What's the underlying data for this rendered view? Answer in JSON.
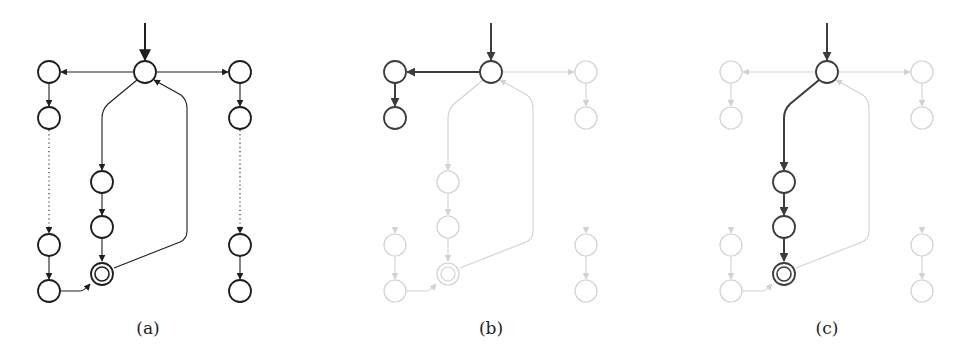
{
  "figure": {
    "colors": {
      "normal": "#1e1e1e",
      "highlight": "#3c3c3c",
      "faded": "#d2d2d2",
      "background": "#ffffff"
    },
    "node_radius": 11,
    "panels": [
      {
        "id": "a",
        "caption": "(a)",
        "caption_x": 148,
        "offset_x": 0,
        "style": "normal",
        "highlight_nodes": [],
        "highlight_edges": []
      },
      {
        "id": "b",
        "caption": "(b)",
        "caption_x": 491,
        "offset_x": 346,
        "style": "faded",
        "highlight_nodes": [
          "top",
          "L1",
          "L2"
        ],
        "highlight_edges": [
          "start",
          "top-L1",
          "L1-L2"
        ]
      },
      {
        "id": "c",
        "caption": "(c)",
        "caption_x": 827,
        "offset_x": 682,
        "style": "faded",
        "highlight_nodes": [
          "top",
          "M1",
          "M2",
          "F"
        ],
        "highlight_edges": [
          "start",
          "top-M1",
          "M1-M2",
          "M2-F"
        ]
      }
    ],
    "nodes": [
      {
        "id": "top",
        "x": 145,
        "y": 72,
        "accepting": false
      },
      {
        "id": "L1",
        "x": 49,
        "y": 72,
        "accepting": false
      },
      {
        "id": "L2",
        "x": 49,
        "y": 118,
        "accepting": false
      },
      {
        "id": "L3",
        "x": 49,
        "y": 245,
        "accepting": false
      },
      {
        "id": "L4",
        "x": 49,
        "y": 291,
        "accepting": false
      },
      {
        "id": "R1",
        "x": 240,
        "y": 72,
        "accepting": false
      },
      {
        "id": "R2",
        "x": 240,
        "y": 118,
        "accepting": false
      },
      {
        "id": "R3",
        "x": 240,
        "y": 245,
        "accepting": false
      },
      {
        "id": "R4",
        "x": 240,
        "y": 291,
        "accepting": false
      },
      {
        "id": "M1",
        "x": 102,
        "y": 182,
        "accepting": false
      },
      {
        "id": "M2",
        "x": 102,
        "y": 227,
        "accepting": false
      },
      {
        "id": "F",
        "x": 102,
        "y": 274,
        "accepting": true
      }
    ],
    "edges": [
      {
        "id": "start",
        "path": "M145 23 L145 60",
        "dotted": false
      },
      {
        "id": "top-L1",
        "path": "M134 72 L61 72",
        "dotted": false
      },
      {
        "id": "top-R1",
        "path": "M156 72 L228 72",
        "dotted": false
      },
      {
        "id": "L1-L2",
        "path": "M49 83 L49 106",
        "dotted": false
      },
      {
        "id": "R1-R2",
        "path": "M240 83 L240 106",
        "dotted": false
      },
      {
        "id": "L2-L3",
        "path": "M49 130 L49 233",
        "dotted": true
      },
      {
        "id": "R2-R3",
        "path": "M240 130 L240 233",
        "dotted": true
      },
      {
        "id": "L3-L4",
        "path": "M49 256 L49 279",
        "dotted": false
      },
      {
        "id": "R3-R4",
        "path": "M240 256 L240 279",
        "dotted": false
      },
      {
        "id": "top-M1",
        "path": "M137 80 L108 104 Q102 110 102 118 L102 170",
        "dotted": false
      },
      {
        "id": "M1-M2",
        "path": "M102 193 L102 215",
        "dotted": false
      },
      {
        "id": "M2-F",
        "path": "M102 238 L102 261",
        "dotted": false
      },
      {
        "id": "L4-F",
        "path": "M60 291 L80 291 Q84 291 90 284",
        "dotted": false
      },
      {
        "id": "F-top",
        "path": "M114 268 L180 242 Q187 239 187 231 L187 108 Q187 100 181 95 L154 80",
        "dotted": false
      }
    ]
  }
}
